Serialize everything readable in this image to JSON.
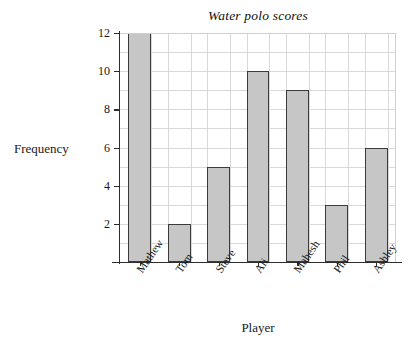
{
  "chart_data": {
    "type": "bar",
    "title": "Water polo scores",
    "xlabel": "Player",
    "ylabel": "Frequency",
    "categories": [
      "Mathew",
      "Tom",
      "Steve",
      "Ali",
      "Mahesh",
      "Phil",
      "Ashley"
    ],
    "values": [
      12,
      2,
      5,
      10,
      9,
      3,
      6
    ],
    "ylim": [
      0,
      12
    ],
    "ytick_labels": [
      "2",
      "4",
      "6",
      "8",
      "10",
      "12"
    ],
    "ytick_values": [
      2,
      4,
      6,
      8,
      10,
      12
    ],
    "gridline_values": [
      1,
      2,
      3,
      4,
      5,
      6,
      7,
      8,
      9,
      10,
      11,
      12
    ],
    "grid": "both",
    "legend": "none",
    "bar_fill_color": "#c6c6c6",
    "bar_edge_color": "#3a3a3a",
    "grid_color": "#d9d9d9",
    "axis_color": "#2e2e2e",
    "background_color": "#ffffff",
    "xtick_label_rotation": -55
  }
}
